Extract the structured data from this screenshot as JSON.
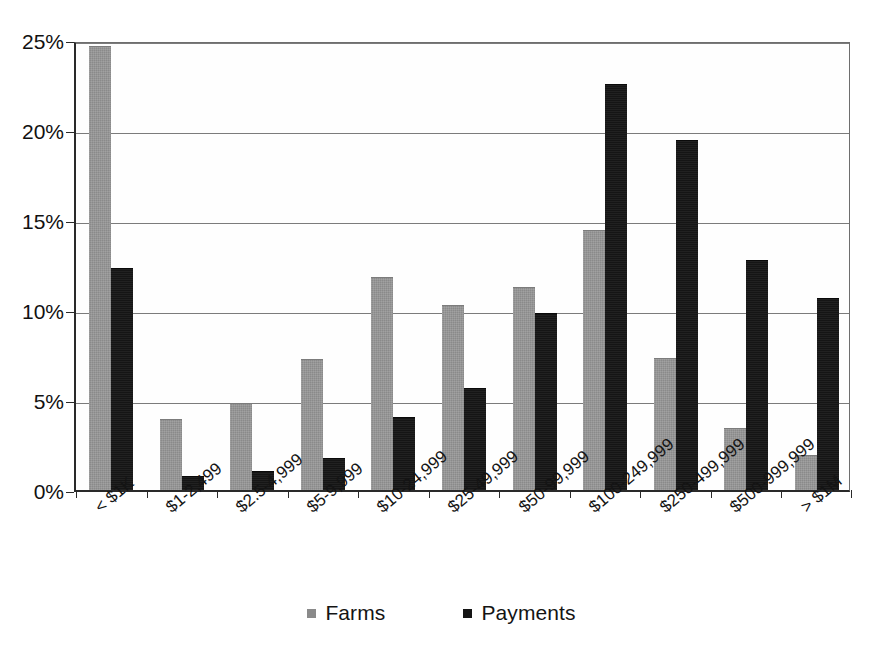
{
  "chart_data": {
    "type": "bar",
    "title": "",
    "xlabel": "",
    "ylabel": "",
    "ylim": [
      0,
      25
    ],
    "grid": true,
    "legend_position": "bottom",
    "categories": [
      "< $1K",
      "$1-2,499",
      "$2.5-4,999",
      "$5-9,999",
      "$10-24,999",
      "$25-49,999",
      "$50-99,999",
      "$100-249,999",
      "$250-499,999",
      "$500-999,999",
      "> $1M"
    ],
    "ytick_labels": [
      "0%",
      "5%",
      "10%",
      "15%",
      "20%",
      "25%"
    ],
    "ytick_values": [
      0,
      5,
      10,
      15,
      20,
      25
    ],
    "series": [
      {
        "name": "Farms",
        "color": "#8a8a8a",
        "values": [
          24.6,
          3.9,
          4.8,
          7.2,
          11.8,
          10.2,
          11.2,
          14.4,
          7.3,
          3.4,
          1.9
        ]
      },
      {
        "name": "Payments",
        "color": "#151515",
        "values": [
          12.3,
          0.7,
          1.0,
          1.7,
          4.0,
          5.6,
          9.8,
          22.5,
          19.4,
          12.7,
          10.6
        ]
      }
    ]
  }
}
